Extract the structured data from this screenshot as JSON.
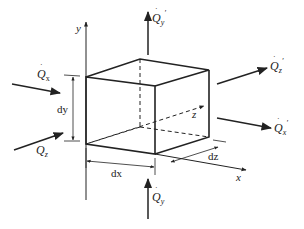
{
  "diagram": {
    "colors": {
      "line": "#222222",
      "background": "#ffffff"
    },
    "axes": {
      "x": {
        "label": "x"
      },
      "y": {
        "label": "y"
      },
      "z": {
        "label": "z"
      }
    },
    "dimensions": {
      "dx": "dx",
      "dy": "dy",
      "dz": "dz"
    },
    "heat_flows": {
      "qx_in": {
        "symbol": "Q",
        "subscript": "x",
        "prime": "",
        "direction": "in"
      },
      "qx_out": {
        "symbol": "Q",
        "subscript": "x",
        "prime": "′",
        "direction": "out"
      },
      "qy_in": {
        "symbol": "Q",
        "subscript": "y",
        "prime": "",
        "direction": "in"
      },
      "qy_out": {
        "symbol": "Q",
        "subscript": "y",
        "prime": "′",
        "direction": "out"
      },
      "qz_in": {
        "symbol": "Q",
        "subscript": "z",
        "prime": "",
        "direction": "in"
      },
      "qz_out": {
        "symbol": "Q",
        "subscript": "z",
        "prime": "′",
        "direction": "out"
      }
    }
  }
}
